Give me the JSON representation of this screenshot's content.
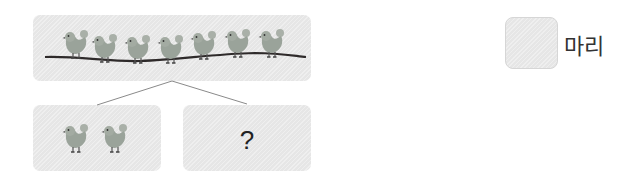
{
  "diagram": {
    "type": "part-whole",
    "whole": {
      "count": 7,
      "icon": "chick-icon"
    },
    "parts": [
      {
        "count": 2,
        "icon": "chick-icon",
        "label": ""
      },
      {
        "count": null,
        "label": "?"
      }
    ],
    "answer": {
      "value": "",
      "unit": "마리"
    },
    "colors": {
      "box": "#e6e6e6",
      "bird": "#9aa39a",
      "branch": "#2e2a2a",
      "line": "#8a8a8a"
    }
  }
}
